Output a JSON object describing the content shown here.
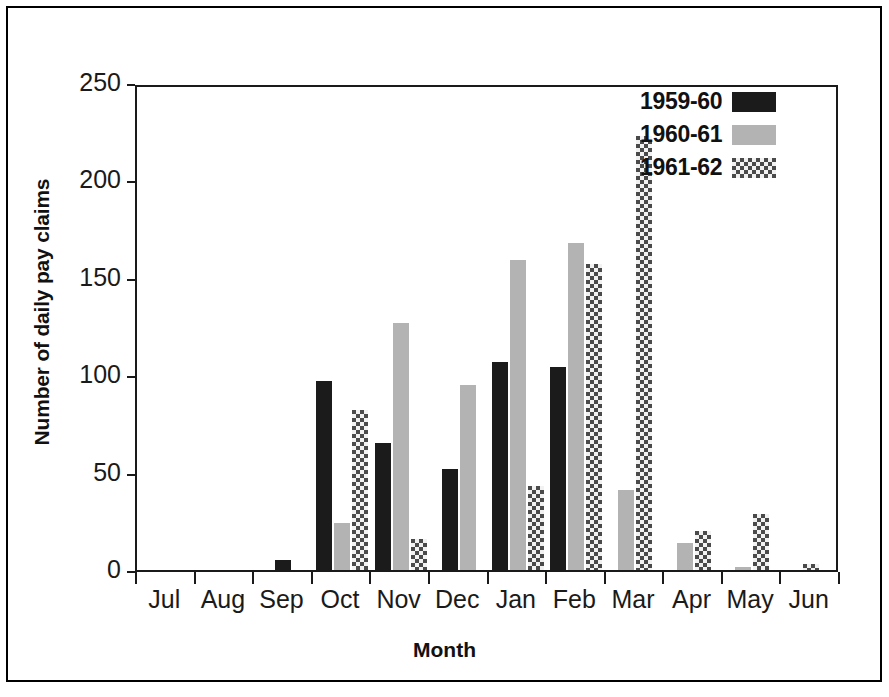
{
  "chart_data": {
    "type": "bar",
    "title": "",
    "xlabel": "Month",
    "ylabel": "Number of daily pay claims",
    "categories": [
      "Jul",
      "Aug",
      "Sep",
      "Oct",
      "Nov",
      "Dec",
      "Jan",
      "Feb",
      "Mar",
      "Apr",
      "May",
      "Jun"
    ],
    "series": [
      {
        "name": "1959-60",
        "color": "#1b1b1b",
        "pattern": "solid",
        "values": [
          0,
          0,
          5,
          97,
          65,
          52,
          107,
          104,
          0,
          0,
          0,
          0
        ]
      },
      {
        "name": "1960-61",
        "color": "#b3b3b3",
        "pattern": "solid-light",
        "values": [
          0,
          0,
          0,
          24,
          127,
          95,
          159,
          168,
          41,
          14,
          1,
          0
        ]
      },
      {
        "name": "1961-62",
        "color": "#4a4a4a",
        "pattern": "checkerboard",
        "values": [
          0,
          0,
          0,
          82,
          16,
          0,
          43,
          157,
          223,
          20,
          29,
          3
        ]
      }
    ],
    "ylim": [
      0,
      250
    ],
    "yticks": [
      0,
      50,
      100,
      150,
      200,
      250
    ],
    "ytick_labels": [
      "0",
      "50",
      "100",
      "150",
      "200",
      "250"
    ],
    "grid": false,
    "legend_position": "top-right"
  },
  "legend": {
    "entries": [
      {
        "label": "1959-60"
      },
      {
        "label": "1960-61"
      },
      {
        "label": "1961-62"
      }
    ]
  },
  "axes": {
    "y_title": "Number of daily pay claims",
    "x_title": "Month"
  }
}
